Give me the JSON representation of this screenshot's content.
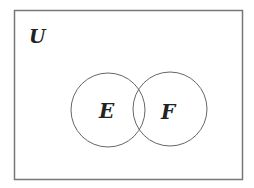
{
  "diagram": {
    "type": "venn",
    "universe": {
      "label": "U"
    },
    "sets": [
      {
        "label": "E"
      },
      {
        "label": "F"
      }
    ]
  }
}
